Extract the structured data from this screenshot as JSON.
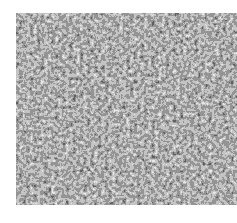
{
  "image": {
    "subject": "grayscale granular speckle texture",
    "tones": {
      "dark": "#1e1e1e",
      "mid": "#8a8a8a",
      "light": "#e6e6e6"
    },
    "background": "#ffffff"
  }
}
